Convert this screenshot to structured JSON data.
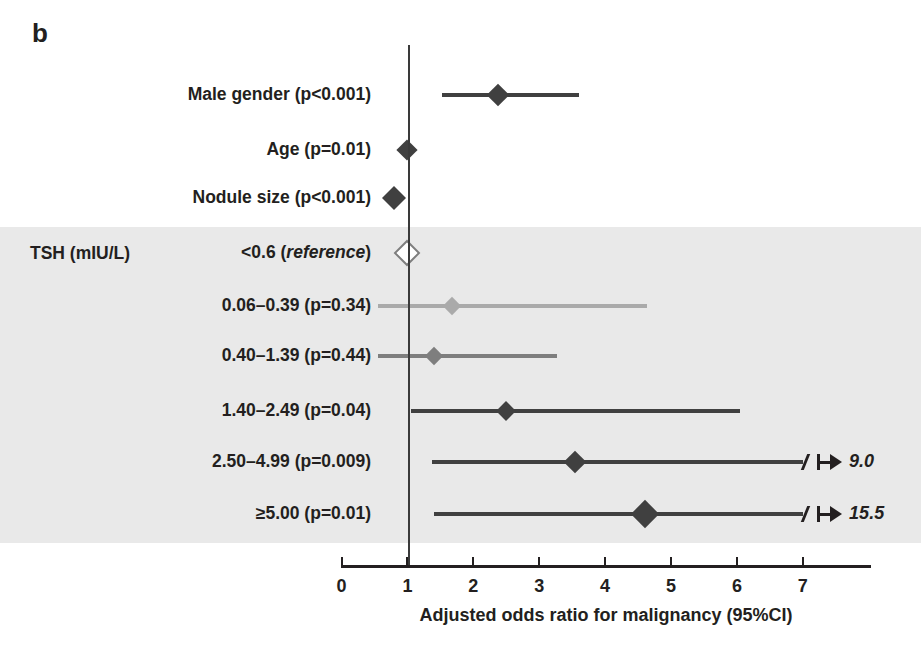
{
  "panel": {
    "letter": "b"
  },
  "group": {
    "label": "TSH (mIU/L)"
  },
  "axis": {
    "title": "Adjusted odds ratio for malignancy (95%CI)",
    "ticks": [
      "0",
      "1",
      "2",
      "3",
      "4",
      "5",
      "6",
      "7"
    ],
    "min": 0,
    "max": 7.8,
    "reference_value": 1
  },
  "colors": {
    "dark": "#404040",
    "mid": "#7e7e7e",
    "light": "#aaaaaa",
    "band": "#e9e9e9",
    "axis": "#231f20"
  },
  "rows": [
    {
      "label": "Male gender (p<0.001)",
      "label_html": "Male gender (p&lt;0.001)",
      "or": 2.37,
      "lo": 1.53,
      "hi": 3.61,
      "marker": "filled",
      "shade": "dark",
      "size": 16,
      "truncated": false,
      "upper_label": ""
    },
    {
      "label": "Age (p=0.01)",
      "label_html": "Age (p=0.01)",
      "or": 1.0,
      "lo": 1.0,
      "hi": 1.0,
      "marker": "filled",
      "shade": "dark",
      "size": 15,
      "truncated": false,
      "upper_label": ""
    },
    {
      "label": "Nodule size (p<0.001)",
      "label_html": "Nodule size (p&lt;0.001)",
      "or": 0.79,
      "lo": 0.79,
      "hi": 0.79,
      "marker": "filled",
      "shade": "dark",
      "size": 17,
      "truncated": false,
      "upper_label": ""
    },
    {
      "label": "<0.6 (reference)",
      "label_html": "&lt;0.6 (<i class=\"ref-ital\">reference</i>)",
      "or": 1.0,
      "lo": 1.0,
      "hi": 1.0,
      "marker": "hollow",
      "shade": "mid",
      "size": 15,
      "truncated": false,
      "upper_label": ""
    },
    {
      "label": "0.06–0.39 (p=0.34)",
      "label_html": "0.06&#8211;0.39 (p=0.34)",
      "or": 1.68,
      "lo": 0.55,
      "hi": 4.63,
      "marker": "filled",
      "shade": "light",
      "size": 13,
      "truncated": false,
      "upper_label": ""
    },
    {
      "label": "0.40–1.39 (p=0.44)",
      "label_html": "0.40&#8211;1.39 (p=0.44)",
      "or": 1.41,
      "lo": 0.55,
      "hi": 3.27,
      "marker": "filled",
      "shade": "mid",
      "size": 13,
      "truncated": false,
      "upper_label": ""
    },
    {
      "label": "1.40–2.49 (p=0.04)",
      "label_html": "1.40&#8211;2.49 (p=0.04)",
      "or": 2.5,
      "lo": 1.06,
      "hi": 6.05,
      "marker": "filled",
      "shade": "dark",
      "size": 14,
      "truncated": false,
      "upper_label": ""
    },
    {
      "label": "2.50–4.99 (p=0.009)",
      "label_html": "2.50&#8211;4.99 (p=0.009)",
      "or": 3.55,
      "lo": 1.37,
      "hi": 9.0,
      "marker": "filled",
      "shade": "dark",
      "size": 16,
      "truncated": true,
      "upper_label": "9.0"
    },
    {
      "label": "≥5.00 (p=0.01)",
      "label_html": "&#8805;5.00 (p=0.01)",
      "or": 4.6,
      "lo": 1.4,
      "hi": 15.5,
      "marker": "filled",
      "shade": "dark",
      "size": 20,
      "truncated": true,
      "upper_label": "15.5"
    }
  ],
  "chart_data": {
    "type": "scatter",
    "title": "b",
    "xlabel": "Adjusted odds ratio for malignancy (95%CI)",
    "ylabel": "",
    "xlim": [
      0,
      7.8
    ],
    "xticks": [
      0,
      1,
      2,
      3,
      4,
      5,
      6,
      7
    ],
    "grid": false,
    "legend": "none",
    "reference_line_x": 1,
    "categories": [
      "Male gender (p<0.001)",
      "Age (p=0.01)",
      "Nodule size (p<0.001)",
      "<0.6 (reference)",
      "0.06–0.39 (p=0.34)",
      "0.40–1.39 (p=0.44)",
      "1.40–2.49 (p=0.04)",
      "2.50–4.99 (p=0.009)",
      "≥5.00 (p=0.01)"
    ],
    "odds_ratios": [
      2.37,
      1.0,
      0.79,
      1.0,
      1.68,
      1.41,
      2.5,
      3.55,
      4.6
    ],
    "ci_lower": [
      1.53,
      null,
      null,
      null,
      0.55,
      0.55,
      1.06,
      1.37,
      1.4
    ],
    "ci_upper": [
      3.61,
      null,
      null,
      null,
      4.63,
      3.27,
      6.05,
      9.0,
      15.5
    ],
    "truncated_at_axis_max": [
      false,
      false,
      false,
      false,
      false,
      false,
      false,
      true,
      true
    ],
    "annotations": [
      "",
      "",
      "",
      "reference",
      "",
      "",
      "",
      "9.0",
      "15.5"
    ],
    "group_heading": "TSH (mIU/L)",
    "shaded_band_rows": [
      "<0.6 (reference)",
      "0.06–0.39 (p=0.34)",
      "0.40–1.39 (p=0.44)",
      "1.40–2.49 (p=0.04)",
      "2.50–4.99 (p=0.009)",
      "≥5.00 (p=0.01)"
    ]
  }
}
